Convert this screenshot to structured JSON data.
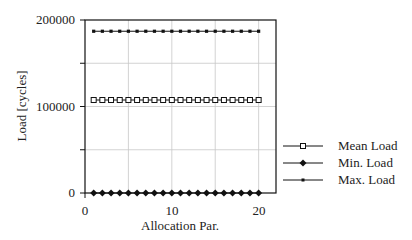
{
  "chart_data": {
    "type": "line",
    "title": "",
    "xlabel": "Allocation Par.",
    "ylabel": "Load [cycles]",
    "xlim": [
      0,
      22
    ],
    "ylim": [
      0,
      200000
    ],
    "xticks": [
      0,
      10,
      20
    ],
    "yticks": [
      0,
      100000,
      200000
    ],
    "x_gridlines": [
      5,
      10,
      15,
      20
    ],
    "y_gridlines": [
      50000,
      100000,
      150000
    ],
    "grid": true,
    "legend_position": "right-outside",
    "x": [
      1,
      2,
      3,
      4,
      5,
      6,
      7,
      8,
      9,
      10,
      11,
      12,
      13,
      14,
      15,
      16,
      17,
      18,
      19,
      20
    ],
    "series": [
      {
        "name": "Mean Load",
        "marker": "open-square",
        "values": [
          107500,
          107500,
          107500,
          107500,
          107500,
          107500,
          107500,
          107500,
          107500,
          107500,
          107500,
          107500,
          107500,
          107500,
          107500,
          107500,
          107500,
          107500,
          107500,
          107500
        ]
      },
      {
        "name": "Min. Load",
        "marker": "filled-diamond",
        "values": [
          0,
          0,
          0,
          0,
          0,
          0,
          0,
          0,
          0,
          0,
          0,
          0,
          0,
          0,
          0,
          0,
          0,
          0,
          0,
          0
        ]
      },
      {
        "name": "Max. Load",
        "marker": "small-filled-square",
        "values": [
          187000,
          187000,
          187000,
          187000,
          187000,
          187000,
          187000,
          187000,
          187000,
          187000,
          187000,
          187000,
          187000,
          187000,
          187000,
          187000,
          187000,
          187000,
          187000,
          187000
        ]
      }
    ]
  },
  "axes": {
    "xlabel": "Allocation Par.",
    "ylabel": "Load [cycles]",
    "xtick_labels": [
      "0",
      "10",
      "20"
    ],
    "ytick_labels": [
      "0",
      "100000",
      "200000"
    ]
  },
  "legend": {
    "items": [
      {
        "label": "Mean Load",
        "marker": "open-square"
      },
      {
        "label": "Min. Load",
        "marker": "filled-diamond"
      },
      {
        "label": "Max. Load",
        "marker": "small-filled-square"
      }
    ]
  },
  "colors": {
    "line": "#111111",
    "grid": "#c8c8c8",
    "frame": "#111111",
    "background": "#ffffff"
  }
}
